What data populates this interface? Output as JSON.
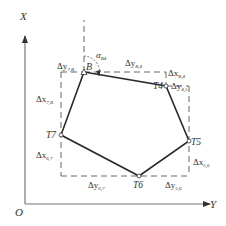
{
  "diagram": {
    "type": "traverse-coordinate-diagram",
    "axes": {
      "vertical_label": "X",
      "horizontal_label": "Y",
      "origin_label": "O"
    },
    "points": [
      {
        "id": "B",
        "label": "B",
        "x": 84,
        "y": 72
      },
      {
        "id": "T4",
        "label": "T4",
        "x": 166,
        "y": 86
      },
      {
        "id": "T5",
        "label": "T5",
        "x": 189,
        "y": 141
      },
      {
        "id": "T6",
        "label": "T6",
        "x": 139,
        "y": 176
      },
      {
        "id": "T7",
        "label": "T7",
        "x": 61,
        "y": 135
      }
    ],
    "angle_label": {
      "symbol": "α",
      "subscript": "B4"
    },
    "increments": [
      {
        "symbol": "Δy",
        "subscript": "7,B"
      },
      {
        "symbol": "Δx",
        "subscript": "7,B"
      },
      {
        "symbol": "Δy",
        "subscript": "B,4"
      },
      {
        "symbol": "Δx",
        "subscript": "B,4"
      },
      {
        "symbol": "Δy",
        "subscript": "4,5"
      },
      {
        "symbol": "Δx",
        "subscript": "5,6"
      },
      {
        "symbol": "Δy",
        "subscript": "5,6"
      },
      {
        "symbol": "Δy",
        "subscript": "6,7"
      },
      {
        "symbol": "Δx",
        "subscript": "6,7"
      }
    ],
    "colors": {
      "line": "#2a2a2a",
      "axis": "#555555",
      "dash": "#555555",
      "text": "#333333"
    }
  }
}
